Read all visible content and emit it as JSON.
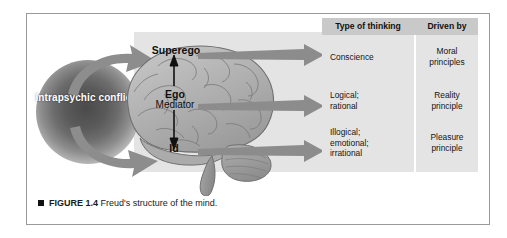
{
  "figure": {
    "caption_bullet": "■",
    "caption_number": "FIGURE 1.4",
    "caption_text": "Freud's structure of the mind."
  },
  "diagram": {
    "conflict_label": "Intrapsychic\nconflicts",
    "brain_labels": {
      "superego": "Superego",
      "ego": "Ego",
      "ego_subtitle": "Mediator",
      "id": "Id"
    },
    "icons": {
      "brain": "brain-icon",
      "conflict_blob": "radial-blob-icon",
      "curved_arrow_upper": "curved-arrow-icon",
      "curved_arrow_lower": "curved-arrow-icon",
      "vertical_double_arrow": "double-headed-arrow-icon",
      "row_arrow": "right-arrow-icon"
    },
    "colors": {
      "panel_background": "#e4e4e4",
      "header_background": "#c9c9c9",
      "arrow_gray": "#8a8a8a",
      "arrow_head_gray": "#777777",
      "brain_fill": "#b9b9b9",
      "frame_border": "#9a9a9a",
      "text": "#141414"
    }
  },
  "table": {
    "headers": [
      "Type of thinking",
      "Driven by"
    ],
    "rows": [
      {
        "type_of_thinking": "Conscience",
        "driven_by": "Moral\nprinciples"
      },
      {
        "type_of_thinking": "Logical;\nrational",
        "driven_by": "Reality\nprinciple"
      },
      {
        "type_of_thinking": "Illogical;\nemotional;\nirrational",
        "driven_by": "Pleasure\nprinciple"
      }
    ]
  }
}
